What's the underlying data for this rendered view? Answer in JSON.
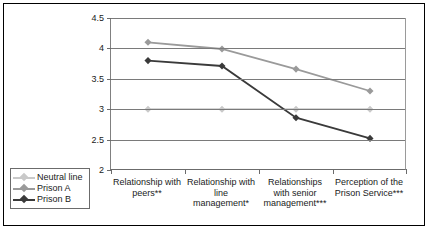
{
  "chart_data": {
    "type": "line",
    "title": "",
    "xlabel": "",
    "ylabel": "",
    "ylim": [
      2,
      4.5
    ],
    "yticks": [
      "2",
      "2.5",
      "3",
      "3.5",
      "4",
      "4.5"
    ],
    "ytick_values": [
      2,
      2.5,
      3,
      3.5,
      4,
      4.5
    ],
    "grid": true,
    "legend_position": "bottom-left",
    "categories": [
      "Relationship with peers**",
      "Relationship with line management*",
      "Relationships with senior management***",
      "Perception of the Prison Service***"
    ],
    "series": [
      {
        "name": "Neutral line",
        "color": "#c9c9c9",
        "values": [
          3,
          3,
          3,
          3
        ]
      },
      {
        "name": "Prison A",
        "color": "#9a9a9a",
        "values": [
          4.1,
          3.99,
          3.66,
          3.3
        ]
      },
      {
        "name": "Prison B",
        "color": "#3a3a3a",
        "values": [
          3.8,
          3.71,
          2.86,
          2.52
        ]
      }
    ]
  },
  "legend": {
    "items": [
      {
        "label": "Neutral line"
      },
      {
        "label": "Prison A"
      },
      {
        "label": "Prison B"
      }
    ]
  }
}
